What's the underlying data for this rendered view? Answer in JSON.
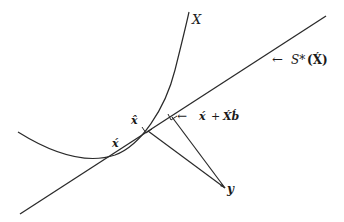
{
  "diagram": {
    "colors": {
      "stroke": "#2a2a2a",
      "text": "#1a1a1a",
      "background": "#ffffff"
    },
    "labels": {
      "manifold": "ᵋ3",
      "manifold_text": "X",
      "tangent_space": "← S*(X́)",
      "tangent_space_prefix": "←",
      "tangent_space_name": "S*",
      "tangent_space_arg": "(X́)",
      "point_x_acute": "x́",
      "point_x_hat": "x̂",
      "linear_approx": "← x́ + X́b́",
      "linear_approx_prefix": "←",
      "linear_approx_x": "x́",
      "linear_approx_plus": "+",
      "linear_approx_Xb": "X́b́",
      "point_y": "y"
    },
    "points": {
      "x_acute": [
        115,
        155
      ],
      "x_hat": [
        147,
        130
      ],
      "x_plus_Xb": [
        172,
        117
      ],
      "y": [
        225,
        188
      ]
    }
  }
}
